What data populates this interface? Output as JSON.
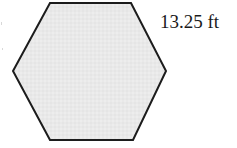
{
  "figure": {
    "name": "regular-hexagon-with-side-length-label",
    "shape": {
      "type": "hexagon",
      "sides": 6,
      "fill_color": "#e9e9e9",
      "stroke_color": "#1c1c1c",
      "stroke_width": 2,
      "vertices": [
        [
          50,
          3
        ],
        [
          131,
          3
        ],
        [
          166,
          71
        ],
        [
          133,
          140
        ],
        [
          50,
          140
        ],
        [
          13,
          71
        ]
      ]
    },
    "labels": {
      "side_length": {
        "text": "13.25 ft",
        "value": "13.25",
        "unit": "ft",
        "color": "#1a1a1a"
      }
    }
  },
  "canvas": {
    "background_color": "#ffffff",
    "width": "237",
    "height": "148"
  }
}
